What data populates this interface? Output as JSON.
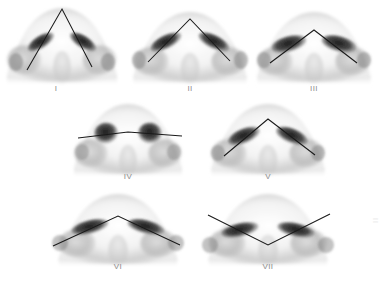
{
  "figure": {
    "background_color": "#ffffff",
    "line_color": "#1a1a1a",
    "label_color": "#8d8d8d",
    "nostril_color": "#262626",
    "shading_color": "#9a9a9a",
    "watermark": "II",
    "rows": 3,
    "columns": [
      3,
      2,
      2
    ]
  },
  "panels": [
    {
      "id": "panel-1",
      "label": "I",
      "label_x": 56,
      "label_y": 88,
      "row": 1,
      "cx": 62,
      "cy": 44,
      "scale": 1.0,
      "nose_width": 112,
      "nose_height": 80,
      "marking": {
        "type": "v-shape",
        "description": "Narrow tall V with sharp apex at nasal tip",
        "apex_x": 62,
        "apex_y": 9,
        "left_x": 27,
        "left_y": 70,
        "right_x": 92,
        "right_y": 67
      },
      "nostril_shape": "narrow-slit",
      "nostril_angle": 34
    },
    {
      "id": "panel-2",
      "label": "II",
      "label_x": 190,
      "label_y": 88,
      "row": 1,
      "cx": 190,
      "cy": 46,
      "scale": 1.0,
      "nose_width": 116,
      "nose_height": 74,
      "marking": {
        "type": "v-shape",
        "description": "Wider V with apex at tip-defining point",
        "apex_x": 190,
        "apex_y": 19,
        "left_x": 148,
        "left_y": 62,
        "right_x": 230,
        "right_y": 61
      },
      "nostril_shape": "oblique-slit",
      "nostril_angle": 28
    },
    {
      "id": "panel-3",
      "label": "III",
      "label_x": 314,
      "label_y": 88,
      "row": 1,
      "cx": 314,
      "cy": 46,
      "scale": 1.0,
      "nose_width": 116,
      "nose_height": 74,
      "marking": {
        "type": "v-shape",
        "description": "Broad flat V, low apex, obtuse angle",
        "apex_x": 314,
        "apex_y": 30,
        "left_x": 270,
        "left_y": 63,
        "right_x": 357,
        "right_y": 63
      },
      "nostril_shape": "broad-oval",
      "nostril_angle": 18
    },
    {
      "id": "panel-4",
      "label": "IV",
      "label_x": 128,
      "label_y": 176,
      "row": 2,
      "cx": 128,
      "cy": 138,
      "scale": 1.0,
      "nose_width": 112,
      "nose_height": 74,
      "marking": {
        "type": "horizontal-line",
        "description": "Near-horizontal transverse line across both nostrils",
        "left_x": 78,
        "left_y": 138,
        "right_x": 182,
        "right_y": 136,
        "apex_x": 128,
        "apex_y": 132
      },
      "nostril_shape": "round",
      "nostril_angle": 5
    },
    {
      "id": "panel-5",
      "label": "V",
      "label_x": 268,
      "label_y": 176,
      "row": 2,
      "cx": 268,
      "cy": 136,
      "scale": 1.0,
      "nose_width": 116,
      "nose_height": 74,
      "marking": {
        "type": "v-shape",
        "description": "Moderate V with apex at tip, limbs to alar bases",
        "apex_x": 268,
        "apex_y": 119,
        "left_x": 224,
        "left_y": 156,
        "right_x": 315,
        "right_y": 155
      },
      "nostril_shape": "oblique-slit",
      "nostril_angle": 24
    },
    {
      "id": "panel-6",
      "label": "VI",
      "label_x": 118,
      "label_y": 266,
      "row": 3,
      "cx": 118,
      "cy": 228,
      "scale": 1.0,
      "nose_width": 120,
      "nose_height": 74,
      "marking": {
        "type": "v-shape",
        "description": "Shallow wide V, apex slightly above nostril level",
        "apex_x": 118,
        "apex_y": 216,
        "left_x": 53,
        "left_y": 246,
        "right_x": 180,
        "right_y": 245
      },
      "nostril_shape": "oblique-slit",
      "nostril_angle": 16
    },
    {
      "id": "panel-7",
      "label": "VII",
      "label_x": 268,
      "label_y": 266,
      "row": 3,
      "cx": 268,
      "cy": 228,
      "scale": 1.0,
      "nose_width": 120,
      "nose_height": 74,
      "marking": {
        "type": "inverted-v",
        "description": "Inverted V — vertex points downward at columella base",
        "apex_x": 268,
        "apex_y": 245,
        "left_x": 208,
        "left_y": 215,
        "right_x": 330,
        "right_y": 214
      },
      "nostril_shape": "oblique-slit",
      "nostril_angle": 14
    }
  ]
}
